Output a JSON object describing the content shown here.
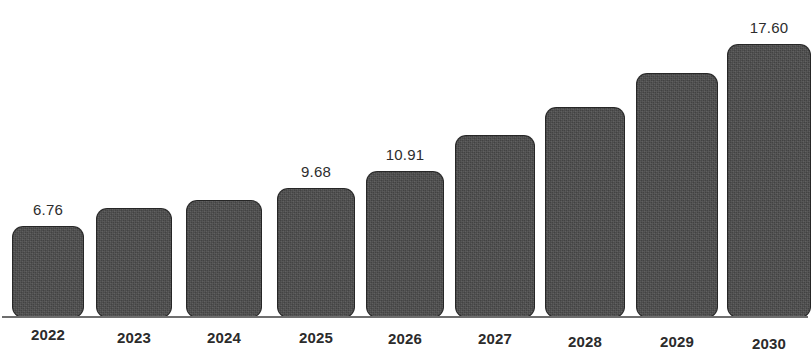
{
  "chart_data": {
    "type": "bar",
    "title": "",
    "subtitle": "",
    "xlabel": "",
    "ylabel": "",
    "grid": false,
    "legend": null,
    "ylim": [
      0,
      19.5
    ],
    "categories": [
      "2022",
      "2023",
      "2024",
      "2025",
      "2026",
      "2027",
      "2028",
      "2029",
      "2030"
    ],
    "values": [
      6.76,
      7.65,
      8.15,
      9.68,
      10.91,
      12.28,
      13.82,
      15.56,
      17.6
    ],
    "value_labels_shown": [
      "6.76",
      "",
      "",
      "9.68",
      "10.91",
      "",
      "",
      "",
      "17.60"
    ],
    "series": [
      {
        "name": "Market size",
        "values": [
          6.76,
          7.65,
          8.15,
          9.68,
          10.91,
          12.28,
          13.82,
          15.56,
          17.6
        ]
      }
    ]
  },
  "style": {
    "bar_color": "#4b4b4b",
    "bar_outline_color": "#202020",
    "axis_color": "#6e6e6e",
    "label_color": "#2d2d2d",
    "background": "#ffffff"
  },
  "bars": [
    {
      "year": "2022",
      "value": 6.76,
      "label": "6.76",
      "x": 12,
      "width": 72,
      "height": 92,
      "label_visible": true,
      "year_offset": 0
    },
    {
      "year": "2023",
      "value": 7.65,
      "label": "7.65",
      "x": 96,
      "width": 76,
      "height": 110,
      "label_visible": false,
      "year_offset": 3
    },
    {
      "year": "2024",
      "value": 8.15,
      "label": "8.15",
      "x": 186,
      "width": 76,
      "height": 118,
      "label_visible": false,
      "year_offset": 3
    },
    {
      "year": "2025",
      "value": 9.68,
      "label": "9.68",
      "x": 277,
      "width": 78,
      "height": 130,
      "label_visible": true,
      "year_offset": 3
    },
    {
      "year": "2026",
      "value": 10.91,
      "label": "10.91",
      "x": 366,
      "width": 78,
      "height": 147,
      "label_visible": true,
      "year_offset": 4
    },
    {
      "year": "2027",
      "value": 12.28,
      "label": "12.28",
      "x": 455,
      "width": 80,
      "height": 183,
      "label_visible": false,
      "year_offset": 4
    },
    {
      "year": "2028",
      "value": 13.82,
      "label": "13.82",
      "x": 545,
      "width": 80,
      "height": 211,
      "label_visible": false,
      "year_offset": 7
    },
    {
      "year": "2029",
      "value": 15.56,
      "label": "15.56",
      "x": 636,
      "width": 82,
      "height": 245,
      "label_visible": false,
      "year_offset": 7
    },
    {
      "year": "2030",
      "value": 17.6,
      "label": "17.60",
      "x": 727,
      "width": 84,
      "height": 274,
      "label_visible": true,
      "year_offset": 9
    }
  ]
}
